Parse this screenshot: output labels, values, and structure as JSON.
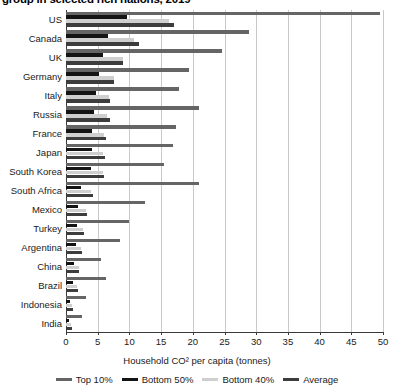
{
  "title": "group in selected rich nations, 2019",
  "chart_data": {
    "type": "bar",
    "orientation": "horizontal",
    "title": "group in selected rich nations, 2019",
    "xlabel": "Household CO² per capita (tonnes)",
    "ylabel": "",
    "xlim": [
      0,
      50
    ],
    "xticks": [
      0,
      5,
      10,
      15,
      20,
      25,
      30,
      35,
      40,
      45,
      50
    ],
    "grid": "vertical",
    "legend_position": "bottom",
    "categories": [
      "US",
      "Canada",
      "UK",
      "Germany",
      "Italy",
      "Russia",
      "France",
      "Japan",
      "South Korea",
      "South Africa",
      "Mexico",
      "Turkey",
      "Argentina",
      "China",
      "Brazil",
      "Indonesia",
      "India"
    ],
    "series": [
      {
        "name": "Top 10%",
        "color": "#656565",
        "values": [
          49.6,
          28.9,
          24.6,
          19.4,
          17.8,
          21.0,
          17.3,
          16.9,
          15.5,
          21.0,
          12.5,
          9.9,
          8.5,
          5.5,
          6.3,
          3.2,
          2.5
        ]
      },
      {
        "name": "Bottom 50%",
        "color": "#141414",
        "values": [
          9.7,
          6.6,
          5.9,
          5.2,
          4.7,
          4.4,
          4.1,
          4.1,
          4.0,
          2.3,
          1.9,
          1.7,
          1.6,
          1.3,
          1.1,
          0.6,
          0.5
        ]
      },
      {
        "name": "Bottom 40%",
        "color": "#cfcfcf",
        "values": [
          16.3,
          10.7,
          9.0,
          7.5,
          6.8,
          6.5,
          6.0,
          5.9,
          5.8,
          4.0,
          3.1,
          2.7,
          2.4,
          2.0,
          1.8,
          1.0,
          0.8
        ]
      },
      {
        "name": "Average",
        "color": "#3d3d3d",
        "values": [
          17.0,
          11.5,
          9.0,
          7.6,
          6.9,
          7.0,
          6.3,
          6.2,
          6.0,
          4.2,
          3.3,
          2.9,
          2.5,
          2.1,
          1.9,
          1.1,
          0.9
        ]
      }
    ]
  },
  "axis": {
    "x_title": "Household CO² per capita (tonnes)",
    "tick_labels": [
      "0",
      "5",
      "10",
      "15",
      "20",
      "25",
      "30",
      "35",
      "40",
      "45",
      "50"
    ]
  },
  "legend": [
    {
      "label": "Top 10%",
      "color": "#656565"
    },
    {
      "label": "Bottom 50%",
      "color": "#141414"
    },
    {
      "label": "Bottom 40%",
      "color": "#cfcfcf"
    },
    {
      "label": "Average",
      "color": "#3d3d3d"
    }
  ]
}
